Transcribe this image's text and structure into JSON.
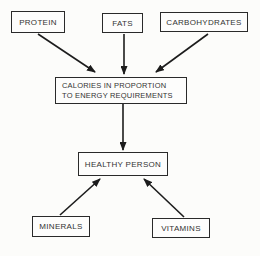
{
  "diagram": {
    "title": "",
    "background_color": "#fcfcfa",
    "line_color": "#1c1c1c",
    "text_color": "#333333",
    "nodes": {
      "protein": {
        "label": "PROTEIN"
      },
      "fats": {
        "label": "FATS"
      },
      "carbohydrates": {
        "label": "CARBOHYDRATES"
      },
      "calories": {
        "line1": "CALORIES IN PROPORTION",
        "line2": "TO ENERGY REQUIREMENTS"
      },
      "healthy_person": {
        "label": "HEALTHY PERSON"
      },
      "minerals": {
        "label": "MINERALS"
      },
      "vitamins": {
        "label": "VITAMINS"
      }
    },
    "edges": [
      {
        "from": "protein",
        "to": "calories"
      },
      {
        "from": "fats",
        "to": "calories"
      },
      {
        "from": "carbohydrates",
        "to": "calories"
      },
      {
        "from": "calories",
        "to": "healthy_person"
      },
      {
        "from": "minerals",
        "to": "healthy_person"
      },
      {
        "from": "vitamins",
        "to": "healthy_person"
      }
    ]
  }
}
